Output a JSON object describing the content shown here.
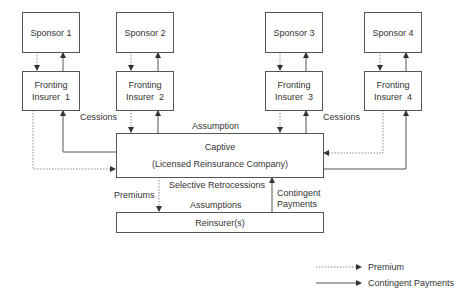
{
  "sponsors": [
    {
      "label": "Sponsor 1"
    },
    {
      "label": "Sponsor 2"
    },
    {
      "label": "Sponsor 3"
    },
    {
      "label": "Sponsor 4"
    }
  ],
  "fronting": [
    {
      "line1": "Fronting",
      "line2": "Insurer  1"
    },
    {
      "line1": "Fronting",
      "line2": "Insurer  2"
    },
    {
      "line1": "Fronting",
      "line2": "Insurer  3"
    },
    {
      "line1": "Fronting",
      "line2": "Insurer  4"
    }
  ],
  "captive": {
    "line1": "Captive",
    "line2": "(Licensed Reinsurance Company)"
  },
  "reinsurer": {
    "label": "Reinsurer(s)"
  },
  "labels": {
    "cessions_left": "Cessions",
    "cessions_right": "Cessions",
    "assumption": "Assumption",
    "selective_retrocessions": "Selective Retrocessions",
    "premiums": "Premiums",
    "assumptions": "Assumptions",
    "contingent_line1": "Contingent",
    "contingent_line2": "Payments"
  },
  "legend": {
    "premium": "Premium",
    "contingent": "Contingent Payments"
  },
  "colors": {
    "line": "#555555",
    "dotted": "#888888",
    "text": "#333333"
  }
}
